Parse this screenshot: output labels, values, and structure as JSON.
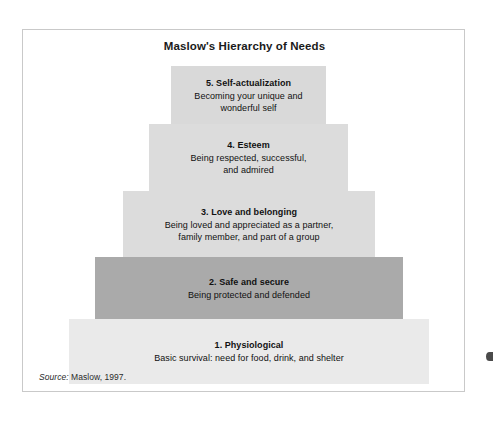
{
  "figure": {
    "title": "Maslow's Hierarchy of Needs",
    "source_label": "Source:",
    "source_text": " Maslow, 1997.",
    "border_color": "#c9c9c9",
    "background": "#ffffff"
  },
  "chart_data": {
    "type": "pyramid",
    "title": "Maslow's Hierarchy of Needs",
    "orientation": "bottom-widest",
    "levels": [
      {
        "rank": 5,
        "label": "5. Self-actualization",
        "description": "Becoming your unique and\nwonderful self",
        "color": "#d9d9d9",
        "width_pct": 43
      },
      {
        "rank": 4,
        "label": "4. Esteem",
        "description": "Being respected, successful,\nand admired",
        "color": "#dcdcdc",
        "width_pct": 55
      },
      {
        "rank": 3,
        "label": "3. Love and belonging",
        "description": "Being loved and appreciated as a partner,\nfamily member, and part of a group",
        "color": "#dcdcdc",
        "width_pct": 70
      },
      {
        "rank": 2,
        "label": "2. Safe and secure",
        "description": "Being protected and defended",
        "color": "#aaaaaa",
        "width_pct": 86
      },
      {
        "rank": 1,
        "label": "1. Physiological",
        "description": "Basic survival: need for food, drink, and shelter",
        "color": "#eaeaea",
        "width_pct": 100
      }
    ]
  }
}
